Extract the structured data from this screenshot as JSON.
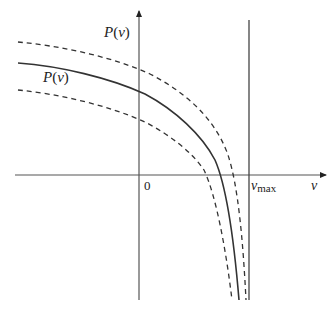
{
  "diagram": {
    "title": "",
    "axes": {
      "y_label": "P(v)",
      "y_label_func": "P",
      "y_label_arg": "v",
      "x_label": "v",
      "origin_label": "0",
      "asymptote_label_main": "v",
      "asymptote_label_sub": "max"
    },
    "curve_label": {
      "func": "P",
      "arg": "v"
    },
    "curves": [
      {
        "name": "P(v)",
        "style": "solid"
      },
      {
        "name": "upper bound",
        "style": "dashed"
      },
      {
        "name": "lower bound",
        "style": "dashed"
      }
    ],
    "colors": {
      "line": "#333333",
      "axis": "#555555",
      "background": "#ffffff"
    }
  }
}
